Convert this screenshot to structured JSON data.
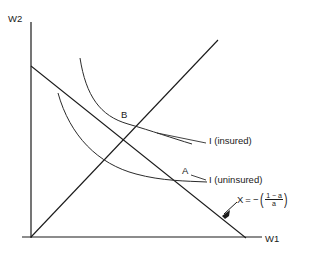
{
  "figure": {
    "type": "diagram",
    "axes": {
      "y_label": "W2",
      "x_label": "W1",
      "origin": [
        31,
        237
      ],
      "y_axis_top": 22,
      "x_axis_right": 262
    },
    "lines": [
      {
        "name": "budget-line",
        "label": "X = - ((1-a)/a)",
        "from": [
          31,
          66
        ],
        "to": [
          245,
          237
        ],
        "slope_description": "negative, equal to -(1-a)/a"
      },
      {
        "name": "forty-five-degree-line",
        "from": [
          31,
          237
        ],
        "to": [
          218,
          40
        ],
        "slope_description": "45 degree certainty line"
      }
    ],
    "curves": [
      {
        "name": "indifference-curve-insured",
        "label": "I (insured)",
        "through_point": "B",
        "from": [
          80,
          58
        ],
        "to": [
          192,
          144
        ]
      },
      {
        "name": "indifference-curve-uninsured",
        "label": "I (uninsured)",
        "through_point": "A",
        "from": [
          58,
          93
        ],
        "to": [
          207,
          182
        ]
      }
    ],
    "points": [
      {
        "name": "point-b",
        "label": "B",
        "at": [
          128,
          124
        ],
        "description": "tangency of insured indifference curve with budget line on 45 degree line"
      },
      {
        "name": "point-a",
        "label": "A",
        "at": [
          189,
          181
        ],
        "description": "uninsured endowment on budget line"
      }
    ],
    "annotations": {
      "formula": {
        "variable": "X",
        "equals": "=",
        "minus": "−",
        "open_paren": "(",
        "numerator": "1 − a",
        "denominator": "a",
        "close_paren": ")",
        "full_text": "X = − ((1 − a)/a)"
      },
      "arrow": {
        "name": "formula-arrow",
        "from": [
          236,
          203
        ],
        "to": [
          222,
          216
        ]
      }
    },
    "colors": {
      "ink": "#1a1a1a",
      "background": "#ffffff"
    }
  }
}
